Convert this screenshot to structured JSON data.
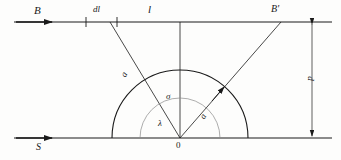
{
  "figure": {
    "type": "geometric-diagram",
    "background_color": "#fdfdfc",
    "stroke_color": "#1a1a1a"
  },
  "labels": {
    "top_line_field": "B",
    "segment_dl": "dl",
    "distance_l": "l",
    "top_line_point": "B'",
    "bottom_line_field": "S",
    "origin": "0",
    "angle_outer": "σ",
    "angle_inner": "λ",
    "ray_right": "a",
    "ray_left": "a",
    "vertical_dimension": "p"
  },
  "geometry": {
    "top_line_y": 22,
    "bottom_line_y": 138,
    "origin_x": 180,
    "outer_arc_radius": 68,
    "inner_arc_radius": 40,
    "tick_positions_x": [
      86,
      117
    ],
    "left_ray_top_x": 110,
    "right_ray_top_x": 281,
    "dimension_line_x": 312
  }
}
